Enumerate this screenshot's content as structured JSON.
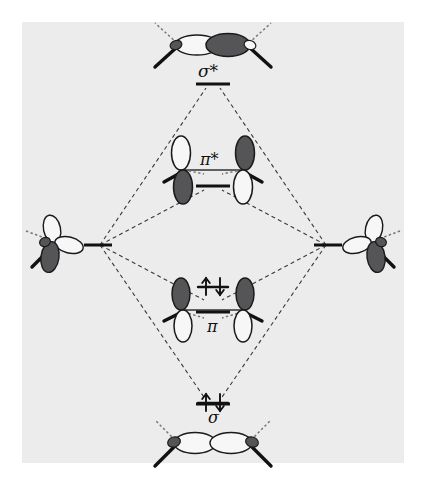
{
  "figure": {
    "type": "molecular-orbital-correlation-diagram",
    "title": "",
    "background_color": "#ffffff",
    "panel_color": "#ececed",
    "lobe_dark_color": "#555558",
    "lobe_light_color": "#f7f7f7",
    "outline_color": "#1a1a1a",
    "correlation_line_style": "dashed",
    "panel": {
      "x": 22,
      "y": 22,
      "width": 382,
      "height": 441
    }
  },
  "levels": [
    {
      "id": "sigma-star",
      "label": "σ*",
      "label_x": 198,
      "label_y": 62,
      "level_x": 213,
      "level_y": 84,
      "level_width": 34,
      "electrons": 0,
      "electron_arrows": "",
      "orbital_kind": "sigma-antibonding",
      "orbital_cx": 213,
      "orbital_cy": 45
    },
    {
      "id": "pi-star",
      "label": "π*",
      "label_x": 200,
      "label_y": 150,
      "level_x": 213,
      "level_y": 186,
      "level_width": 34,
      "electrons": 0,
      "electron_arrows": "",
      "orbital_kind": "pi-antibonding",
      "orbital_cx": 213,
      "orbital_cy": 170
    },
    {
      "id": "pi",
      "label": "π",
      "label_x": 207,
      "label_y": 322,
      "level_x": 213,
      "level_y": 312,
      "level_width": 34,
      "electrons": 2,
      "electron_arrows": "↑↓",
      "orbital_kind": "pi-bonding",
      "orbital_cx": 213,
      "orbital_cy": 310
    },
    {
      "id": "sigma",
      "label": "σ",
      "label_x": 208,
      "label_y": 412,
      "level_x": 213,
      "level_y": 404,
      "level_width": 34,
      "electrons": 2,
      "electron_arrows": "↑↓",
      "orbital_kind": "sigma-bonding",
      "orbital_cx": 213,
      "orbital_cy": 444
    }
  ],
  "atomic_levels": [
    {
      "id": "left-atomic-orbital",
      "side": "left",
      "level_x": 98,
      "level_y": 245,
      "level_width": 30,
      "orbital_cx": 52,
      "orbital_cy": 243,
      "description": "sp2-hybrid trigonal lobes with dark lobe lower-left"
    },
    {
      "id": "right-atomic-orbital",
      "side": "right",
      "level_x": 328,
      "level_y": 245,
      "level_width": 30,
      "orbital_cx": 374,
      "orbital_cy": 243,
      "description": "sp2-hybrid trigonal lobes with dark lobe lower-right"
    }
  ]
}
